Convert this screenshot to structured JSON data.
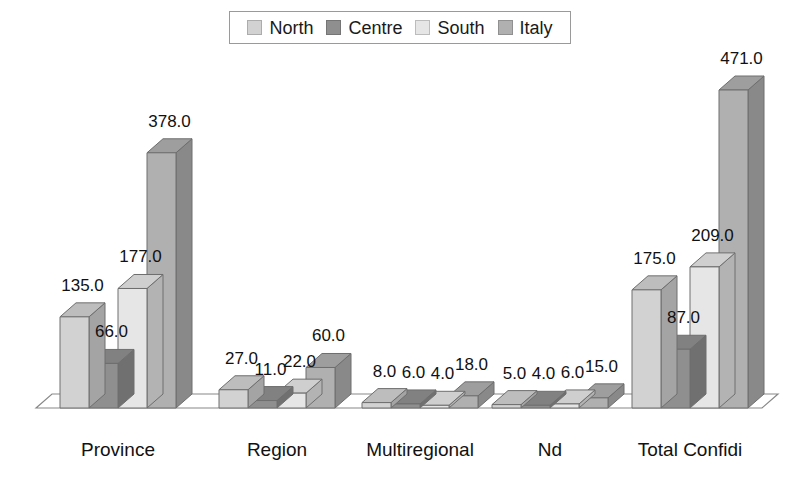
{
  "chart_data": {
    "type": "bar",
    "title": "",
    "subtitle": "",
    "xlabel": "",
    "ylabel": "",
    "categories": [
      "Province",
      "Region",
      "Multiregional",
      "Nd",
      "Total Confidi"
    ],
    "series": [
      {
        "name": "North",
        "color": "#d2d2d2",
        "values": [
          135.0,
          27.0,
          8.0,
          5.0,
          175.0
        ]
      },
      {
        "name": "Centre",
        "color": "#8f8f8f",
        "values": [
          66.0,
          11.0,
          6.0,
          4.0,
          87.0
        ]
      },
      {
        "name": "South",
        "color": "#e6e6e6",
        "values": [
          177.0,
          22.0,
          4.0,
          6.0,
          209.0
        ]
      },
      {
        "name": "Italy",
        "color": "#b0b0b0",
        "values": [
          378.0,
          60.0,
          18.0,
          15.0,
          471.0
        ]
      }
    ],
    "value_labels": [
      [
        "135.0",
        "66.0",
        "177.0",
        "378.0"
      ],
      [
        "27.0",
        "11.0",
        "22.0",
        "60.0"
      ],
      [
        "8.0",
        "6.0",
        "4.0",
        "18.0"
      ],
      [
        "5.0",
        "4.0",
        "6.0",
        "15.0"
      ],
      [
        "175.0",
        "87.0",
        "209.0",
        "471.0"
      ]
    ],
    "ylim": [
      0,
      471
    ],
    "grid": false,
    "legend_position": "top-center",
    "style": "3d-bar",
    "axis_line_color": "#888888",
    "floor_color": "#ffffff",
    "label_text_color": "#111111"
  },
  "legend": {
    "entries": [
      {
        "label": "North"
      },
      {
        "label": "Centre"
      },
      {
        "label": "South"
      },
      {
        "label": "Italy"
      }
    ]
  }
}
